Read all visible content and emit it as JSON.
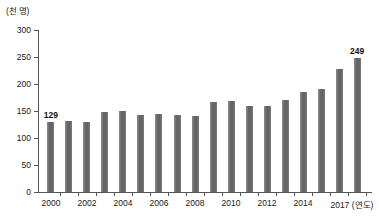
{
  "chart_data": {
    "type": "bar",
    "title": "",
    "subtitle": "",
    "xlabel": "(연도)",
    "ylabel": "(천 명)",
    "yunit_caption": "(천 명)",
    "xaxis_unit_caption": "(연도)",
    "ylim": [
      0,
      300
    ],
    "ytick_values": [
      300,
      250,
      200,
      150,
      100,
      50,
      0
    ],
    "ytick_labels": [
      "300",
      "250",
      "200",
      "150",
      "100",
      "50",
      "0"
    ],
    "grid": false,
    "legend": null,
    "legend_position": "none",
    "categories": [
      "2000",
      "2001",
      "2002",
      "2003",
      "2004",
      "2005",
      "2006",
      "2007",
      "2008",
      "2009",
      "2010",
      "2011",
      "2012",
      "2013",
      "2014",
      "2015",
      "2016",
      "2017"
    ],
    "values": [
      129,
      132,
      130,
      149,
      150,
      143,
      145,
      143,
      140,
      166,
      168,
      159,
      160,
      170,
      186,
      190,
      228,
      249
    ],
    "bar_color": "#6e6e6e",
    "axis_color": "#555555",
    "text_color": "#1a1a1a",
    "annotations": [
      {
        "category": "2000",
        "value": 129,
        "label": "129"
      },
      {
        "category": "2017",
        "value": 249,
        "label": "249"
      }
    ],
    "xtick_labels_shown": [
      {
        "category": "2000",
        "label": "2000"
      },
      {
        "category": "2002",
        "label": "2002"
      },
      {
        "category": "2004",
        "label": "2004"
      },
      {
        "category": "2006",
        "label": "2006"
      },
      {
        "category": "2008",
        "label": "2008"
      },
      {
        "category": "2010",
        "label": "2010"
      },
      {
        "category": "2012",
        "label": "2012"
      },
      {
        "category": "2014",
        "label": "2014"
      },
      {
        "category": "2017",
        "label": "2017 (연도)"
      }
    ]
  }
}
